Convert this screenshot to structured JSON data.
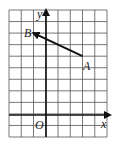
{
  "diagram": {
    "type": "coordinate-grid-vector",
    "grid": {
      "columns": 8,
      "rows": 11,
      "x_range": [
        -3,
        5
      ],
      "y_range": [
        -2,
        9
      ],
      "origin_col": 3,
      "origin_row_from_top": 9
    },
    "axes": {
      "x_label": "x",
      "y_label": "y",
      "origin_label": "O"
    },
    "points": [
      {
        "label": "A",
        "x": 3,
        "y": 5
      },
      {
        "label": "B",
        "x": -1,
        "y": 7
      }
    ],
    "vector": {
      "from": "A",
      "to": "B"
    },
    "colors": {
      "grid": "#555555",
      "axis": "#111111",
      "vector": "#111111",
      "background": "#ffffff"
    }
  }
}
